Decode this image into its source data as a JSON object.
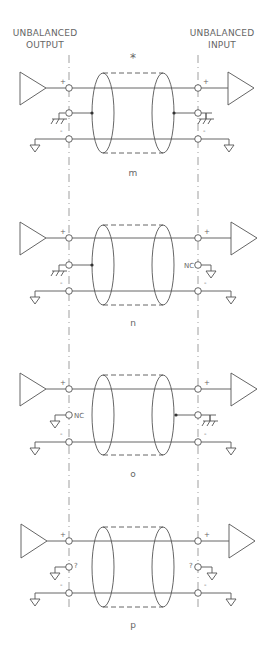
{
  "header": {
    "left_line1": "UNBALANCED",
    "left_line2": "OUTPUT",
    "right_line1": "UNBALANCED",
    "right_line2": "INPUT",
    "asterisk": "*"
  },
  "panels": [
    {
      "id": "m",
      "label": "m",
      "left_middle": "chassis-ground",
      "right_middle": "chassis-ground",
      "left_nc": "",
      "right_nc": ""
    },
    {
      "id": "n",
      "label": "n",
      "left_middle": "chassis-ground",
      "right_middle": "nc-ground",
      "left_nc": "",
      "right_nc": "NC"
    },
    {
      "id": "o",
      "label": "o",
      "left_middle": "nc-ground",
      "right_middle": "chassis-ground",
      "left_nc": "NC",
      "right_nc": ""
    },
    {
      "id": "p",
      "label": "p",
      "left_middle": "unknown-ground",
      "right_middle": "unknown-ground",
      "left_nc": "?",
      "right_nc": "?"
    }
  ],
  "pins": {
    "plus": "+",
    "minus": "-"
  },
  "colors": {
    "line": "#555555",
    "text": "#666666",
    "background": "#ffffff"
  }
}
